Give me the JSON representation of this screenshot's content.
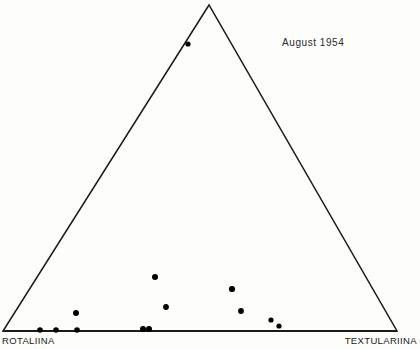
{
  "figure": {
    "name": "ternary-diagram",
    "width": 420,
    "height": 349,
    "background_color": "#fdfdfc",
    "line_color": "#1a1a1a",
    "point_color": "#000000"
  },
  "title": {
    "text": "August 1954",
    "month": "August",
    "year": "1954"
  },
  "labels": {
    "left_vertex": "ROTALIINA",
    "right_vertex": "TEXTULARIINA",
    "apex": ""
  },
  "chart_data": {
    "type": "scatter",
    "subtitle": "",
    "xlabel": "",
    "ylabel": "",
    "grid": false,
    "legend": "none",
    "projection": "ternary",
    "axis_corners": {
      "apex": {
        "x": 209,
        "y": 5,
        "label": ""
      },
      "bottom_left": {
        "x": 3,
        "y": 331,
        "label": "ROTALIINA"
      },
      "bottom_right": {
        "x": 397,
        "y": 331,
        "label": "TEXTULARIINA"
      }
    },
    "xlim": [
      0,
      420
    ],
    "ylim": [
      0,
      349
    ],
    "point_radius": 3,
    "series": [
      {
        "name": "samples",
        "marker": "filled-circle",
        "color": "#000000",
        "points": [
          {
            "x": 188,
            "y": 44,
            "r": 2.6,
            "ternary": {
              "rotaliina": 9,
              "textulariina": 2,
              "apex": 89
            }
          },
          {
            "x": 155,
            "y": 277,
            "r": 3.0,
            "ternary": {
              "rotaliina": 57,
              "textulariina": 26,
              "apex": 17
            }
          },
          {
            "x": 166,
            "y": 307,
            "r": 2.9,
            "ternary": {
              "rotaliina": 56,
              "textulariina": 37,
              "apex": 7
            }
          },
          {
            "x": 232,
            "y": 289,
            "r": 3.1,
            "ternary": {
              "rotaliina": 38,
              "textulariina": 49,
              "apex": 13
            }
          },
          {
            "x": 241,
            "y": 311,
            "r": 2.9,
            "ternary": {
              "rotaliina": 37,
              "textulariina": 57,
              "apex": 6
            }
          },
          {
            "x": 271,
            "y": 320,
            "r": 2.6,
            "ternary": {
              "rotaliina": 29,
              "textulariina": 68,
              "apex": 3
            }
          },
          {
            "x": 279,
            "y": 326,
            "r": 2.6,
            "ternary": {
              "rotaliina": 29,
              "textulariina": 70,
              "apex": 1
            }
          },
          {
            "x": 76,
            "y": 313,
            "r": 3.0,
            "ternary": {
              "rotaliina": 79,
              "textulariina": 16,
              "apex": 5
            }
          },
          {
            "x": 40,
            "y": 330,
            "r": 2.8,
            "ternary": {
              "rotaliina": 91,
              "textulariina": 9,
              "apex": 0
            }
          },
          {
            "x": 56,
            "y": 330,
            "r": 2.8,
            "ternary": {
              "rotaliina": 87,
              "textulariina": 13,
              "apex": 0
            }
          },
          {
            "x": 77,
            "y": 330,
            "r": 2.8,
            "ternary": {
              "rotaliina": 81,
              "textulariina": 19,
              "apex": 0
            }
          },
          {
            "x": 143,
            "y": 329,
            "r": 3.0,
            "ternary": {
              "rotaliina": 64,
              "textulariina": 36,
              "apex": 0
            }
          },
          {
            "x": 149,
            "y": 329,
            "r": 3.0,
            "ternary": {
              "rotaliina": 63,
              "textulariina": 37,
              "apex": 0
            }
          }
        ]
      }
    ]
  }
}
